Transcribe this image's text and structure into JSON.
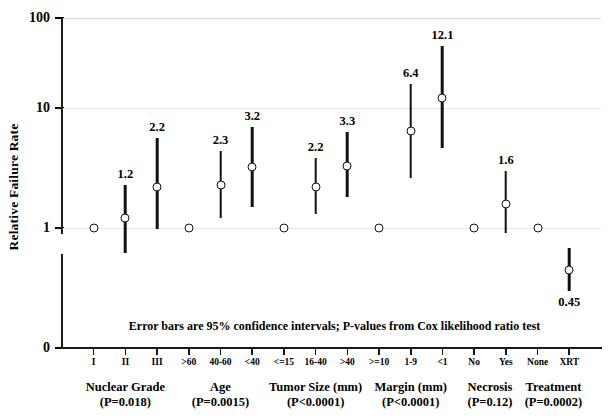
{
  "chart_data": {
    "type": "scatter",
    "title": "",
    "xlabel": "",
    "ylabel": "Relative Failure Rate",
    "yticks": [
      "0",
      "1",
      "10",
      "100"
    ],
    "ylim": [
      1,
      100
    ],
    "yscale": "log",
    "grid": true,
    "legend": false,
    "annotation": "Error bars are 95% confidence intervals;  P-values from Cox likelihood ratio test",
    "groups": [
      {
        "name": "Nuclear Grade",
        "pvalue": "(P=0.018)",
        "categories": [
          "I",
          "II",
          "III"
        ],
        "values": [
          1.0,
          1.2,
          2.2
        ],
        "labels": [
          "",
          "1.2",
          "2.2"
        ],
        "ci_low": [
          null,
          0.62,
          0.98
        ],
        "ci_high": [
          null,
          2.3,
          5.6
        ],
        "reference": [
          true,
          false,
          false
        ]
      },
      {
        "name": "Age",
        "pvalue": "(P=0.0015)",
        "categories": [
          ">60",
          "40-60",
          "<40"
        ],
        "values": [
          1.0,
          2.3,
          3.2
        ],
        "labels": [
          "",
          "2.3",
          "3.2"
        ],
        "ci_low": [
          null,
          1.2,
          1.5
        ],
        "ci_high": [
          null,
          4.4,
          7.0
        ],
        "reference": [
          true,
          false,
          false
        ]
      },
      {
        "name": "Tumor Size (mm)",
        "pvalue": "(P<0.0001)",
        "categories": [
          "<=15",
          "16-40",
          ">40"
        ],
        "values": [
          1.0,
          2.2,
          3.3
        ],
        "labels": [
          "",
          "2.2",
          "3.3"
        ],
        "ci_low": [
          null,
          1.3,
          1.8
        ],
        "ci_high": [
          null,
          3.8,
          6.3
        ],
        "reference": [
          true,
          false,
          false
        ]
      },
      {
        "name": "Margin (mm)",
        "pvalue": "(P<0.0001)",
        "categories": [
          ">=10",
          "1-9",
          "<1"
        ],
        "values": [
          1.0,
          6.4,
          12.1
        ],
        "labels": [
          "",
          "6.4",
          "12.1"
        ],
        "ci_low": [
          null,
          2.6,
          4.6
        ],
        "ci_high": [
          null,
          16.0,
          33.0
        ],
        "reference": [
          true,
          false,
          false
        ]
      },
      {
        "name": "Necrosis",
        "pvalue": "(P=0.12)",
        "categories": [
          "No",
          "Yes"
        ],
        "values": [
          1.0,
          1.6
        ],
        "labels": [
          "",
          "1.6"
        ],
        "ci_low": [
          null,
          0.9
        ],
        "ci_high": [
          null,
          3.0
        ],
        "reference": [
          true,
          false
        ]
      },
      {
        "name": "Treatment",
        "pvalue": "(P=0.0002)",
        "categories": [
          "None",
          "XRT"
        ],
        "values": [
          1.0,
          0.45
        ],
        "labels": [
          "",
          "0.45"
        ],
        "ci_low": [
          null,
          0.3
        ],
        "ci_high": [
          null,
          0.68
        ],
        "reference": [
          true,
          false
        ],
        "label_below": [
          false,
          true
        ]
      }
    ]
  }
}
